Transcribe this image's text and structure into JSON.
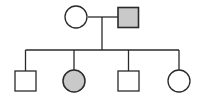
{
  "diagram": {
    "type": "pedigree",
    "colors": {
      "stroke": "#2a2a2a",
      "affected_fill": "#c9c9c9",
      "unaffected_fill": "#ffffff",
      "background": "#ffffff"
    },
    "generations": [
      {
        "label": "parents",
        "members": [
          {
            "id": "mother",
            "sex": "female",
            "shape": "circle",
            "affected": false
          },
          {
            "id": "father",
            "sex": "male",
            "shape": "square",
            "affected": true
          }
        ]
      },
      {
        "label": "children",
        "members": [
          {
            "id": "child-1",
            "sex": "male",
            "shape": "square",
            "affected": false
          },
          {
            "id": "child-2",
            "sex": "female",
            "shape": "circle",
            "affected": true
          },
          {
            "id": "child-3",
            "sex": "male",
            "shape": "square",
            "affected": false
          },
          {
            "id": "child-4",
            "sex": "female",
            "shape": "circle",
            "affected": false
          }
        ]
      }
    ]
  }
}
